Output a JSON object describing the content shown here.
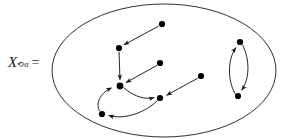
{
  "figure": {
    "title_label": {
      "variable": "X",
      "superscript_circle": "⟲",
      "superscript_alpha": "α",
      "equals": "="
    },
    "stroke_color": "#1a1a1a",
    "node_color": "#000000",
    "background": "#ffffff",
    "container": {
      "shape": "ellipse",
      "cx": 164,
      "cy": 70.5,
      "rx": 112,
      "ry": 66.5
    },
    "nodes": [
      {
        "id": "n1",
        "x": 162,
        "y": 24,
        "label": ""
      },
      {
        "id": "n2",
        "x": 119,
        "y": 48,
        "label": ""
      },
      {
        "id": "n3",
        "x": 160,
        "y": 63,
        "label": ""
      },
      {
        "id": "n4",
        "x": 120,
        "y": 86,
        "label": ""
      },
      {
        "id": "n5",
        "x": 160,
        "y": 98,
        "label": ""
      },
      {
        "id": "n6",
        "x": 102,
        "y": 114,
        "label": ""
      },
      {
        "id": "n7",
        "x": 201,
        "y": 76,
        "label": ""
      },
      {
        "id": "n8",
        "x": 240,
        "y": 42,
        "label": ""
      },
      {
        "id": "n9",
        "x": 238,
        "y": 96,
        "label": ""
      }
    ],
    "edges": [
      {
        "from": "n1",
        "to": "n2",
        "type": "straight"
      },
      {
        "from": "n2",
        "to": "n4",
        "type": "straight"
      },
      {
        "from": "n3",
        "to": "n4",
        "type": "straight"
      },
      {
        "from": "n7",
        "to": "n5",
        "type": "straight"
      },
      {
        "from": "n4",
        "to": "n5",
        "type": "curve"
      },
      {
        "from": "n5",
        "to": "n6",
        "type": "curve"
      },
      {
        "from": "n6",
        "to": "n4",
        "type": "curve"
      },
      {
        "from": "n8",
        "to": "n9",
        "type": "curve"
      },
      {
        "from": "n9",
        "to": "n8",
        "type": "curve"
      }
    ],
    "node_radius": 3.1,
    "arrow_size": 5.2
  }
}
